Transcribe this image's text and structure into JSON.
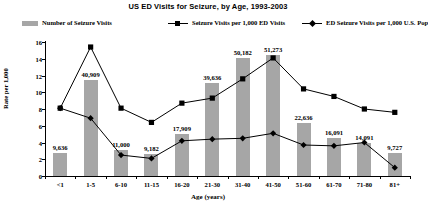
{
  "chart_data": {
    "type": "bar",
    "title": "US ED Visits for Seizure, by Age, 1993-2003",
    "xlabel": "Age  (years)",
    "ylabel": "Rate  per  1,000",
    "categories": [
      "<1",
      "1-5",
      "6-10",
      "11-15",
      "16-20",
      "21-30",
      "31-40",
      "41-50",
      "51-60",
      "61-70",
      "71-80",
      "81+"
    ],
    "ylim": [
      0,
      16
    ],
    "yticks": [
      0,
      2,
      4,
      6,
      8,
      10,
      12,
      14,
      16
    ],
    "grid": false,
    "legend_position": "top",
    "series": [
      {
        "name": "Number of Seizure Visits",
        "type": "bar",
        "color": "#a6a6a6",
        "axis": "counts",
        "values": [
          9636,
          40909,
          11000,
          9182,
          17909,
          39636,
          50182,
          51273,
          22636,
          16091,
          14091,
          9727
        ],
        "labels": [
          "9,636",
          "40,909",
          "11,000",
          "9,182",
          "17,909",
          "39,636",
          "50,182",
          "51,273",
          "22,636",
          "16,091",
          "14,091",
          "9,727"
        ]
      },
      {
        "name": "Seizure Visits per 1,000 ED Visits",
        "type": "line",
        "marker": "square",
        "color": "#000000",
        "values": [
          8.1,
          15.4,
          8.1,
          6.4,
          8.7,
          9.3,
          11.6,
          14.1,
          10.4,
          9.5,
          8.0,
          7.6
        ]
      },
      {
        "name": "ED Seizure Visits per 1,000 U.S. Pop",
        "type": "line",
        "marker": "diamond",
        "color": "#000000",
        "values": [
          8.1,
          6.9,
          2.5,
          2.1,
          4.2,
          4.4,
          4.5,
          5.1,
          3.7,
          3.6,
          4.0,
          1.0
        ]
      }
    ]
  }
}
